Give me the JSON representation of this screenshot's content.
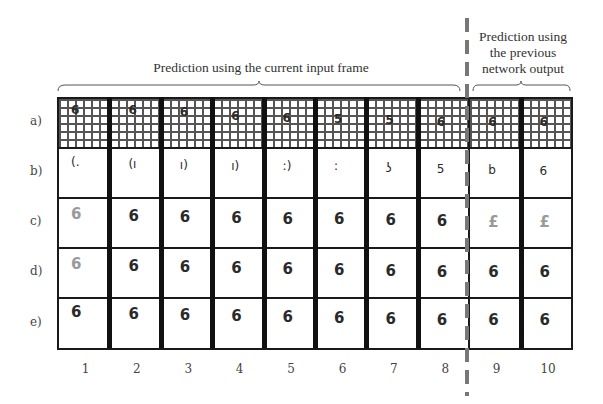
{
  "headers": {
    "left": "Prediction using the current input frame",
    "right": [
      "Prediction using",
      "the previous",
      "network output"
    ]
  },
  "rows": [
    {
      "label": "a)",
      "kind": "occluded-input",
      "digits": [
        "6",
        "6",
        "6",
        "6",
        "6",
        "5",
        "5",
        "6",
        "6",
        "6"
      ]
    },
    {
      "label": "b)",
      "kind": "partial",
      "digits": [
        "(.",
        "(ı",
        "ı)",
        "ı)",
        ":)",
        ":",
        "ʖ",
        "5",
        "b",
        "6"
      ]
    },
    {
      "label": "c)",
      "kind": "prediction",
      "digits": [
        "6",
        "6",
        "6",
        "6",
        "6",
        "6",
        "6",
        "6",
        "£",
        "£"
      ]
    },
    {
      "label": "d)",
      "kind": "prediction",
      "digits": [
        "6",
        "6",
        "6",
        "6",
        "6",
        "6",
        "6",
        "6",
        "6",
        "6"
      ]
    },
    {
      "label": "e)",
      "kind": "ground-truth",
      "digits": [
        "6",
        "6",
        "6",
        "6",
        "6",
        "6",
        "6",
        "6",
        "6",
        "6"
      ]
    }
  ],
  "columns": [
    "1",
    "2",
    "3",
    "4",
    "5",
    "6",
    "7",
    "8",
    "9",
    "10"
  ],
  "colors": {
    "grid_line": "#1a1a1a",
    "mesh": "#555555",
    "divider": "#777777",
    "faint_digit": "#9a9a9a",
    "digit": "#2a2a2a"
  }
}
